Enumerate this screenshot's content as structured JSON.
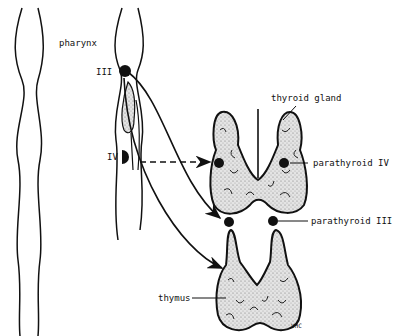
{
  "labels": {
    "pharynx": "pharynx",
    "pouch_iii": "III",
    "pouch_iv": "IV",
    "thyroid_gland": "thyroid gland",
    "parathyroid_iv": "parathyroid IV",
    "parathyroid_iii": "parathyroid III",
    "thymus": "thymus",
    "signature": "VHC"
  },
  "colors": {
    "ink": "#111111",
    "gland_fill": "#d8d8d8",
    "background": "#ffffff"
  }
}
